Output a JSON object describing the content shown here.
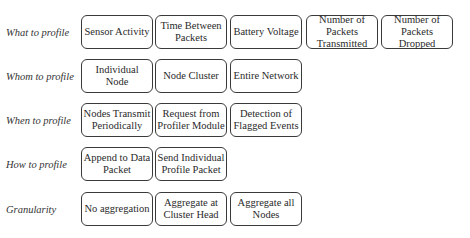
{
  "rows": [
    {
      "label": "What to profile",
      "items": [
        "Sensor Activity",
        "Time Between Packets",
        "Battery Voltage",
        "Number of Packets Transmitted",
        "Number of Packets Dropped"
      ]
    },
    {
      "label": "Whom to profile",
      "items": [
        "Individual Node",
        "Node Cluster",
        "Entire Network"
      ]
    },
    {
      "label": "When to profile",
      "items": [
        "Nodes Transmit Periodically",
        "Request from Profiler Module",
        "Detection of Flagged Events"
      ]
    },
    {
      "label": "How to profile",
      "items": [
        "Append to Data Packet",
        "Send Individual Profile Packet"
      ]
    },
    {
      "label": "Granularity",
      "items": [
        "No aggregation",
        "Aggregate at Cluster Head",
        "Aggregate all Nodes"
      ]
    }
  ]
}
